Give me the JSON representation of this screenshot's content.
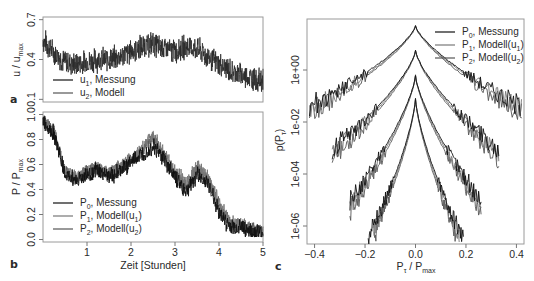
{
  "figure": {
    "panels": [
      "a",
      "b",
      "c"
    ]
  },
  "chart_data": [
    {
      "panel": "a",
      "type": "line",
      "title": "",
      "xlabel": "",
      "ylabel": "u / u_max",
      "ylabel_main": "u / u",
      "ylabel_sub": "max",
      "xlim": [
        0,
        5
      ],
      "ylim": [
        0.08,
        0.72
      ],
      "yticks": [
        0.1,
        0.4,
        0.7
      ],
      "ytick_labels": [
        "0.1",
        "0.4",
        "0.7"
      ],
      "grid": false,
      "legend_position": "bottom-left",
      "legend": [
        {
          "main": "u",
          "sub": "1",
          "rest": ", Messung",
          "color": "#111111"
        },
        {
          "main": "u",
          "sub": "2",
          "rest": ", Modell",
          "color": "#555555"
        }
      ],
      "x": [
        0.0,
        0.25,
        0.5,
        0.75,
        1.0,
        1.25,
        1.5,
        1.75,
        2.0,
        2.25,
        2.5,
        2.75,
        3.0,
        3.25,
        3.5,
        3.75,
        4.0,
        4.25,
        4.5,
        4.75,
        5.0
      ],
      "series": [
        {
          "name": "u1, Messung",
          "center": [
            0.55,
            0.45,
            0.38,
            0.36,
            0.38,
            0.4,
            0.4,
            0.42,
            0.46,
            0.5,
            0.52,
            0.48,
            0.46,
            0.5,
            0.48,
            0.42,
            0.36,
            0.32,
            0.28,
            0.26,
            0.24
          ],
          "amplitude": 0.09
        }
      ]
    },
    {
      "panel": "b",
      "type": "line",
      "title": "",
      "xlabel": "Zeit [Stunden]",
      "ylabel": "P / P_max",
      "ylabel_main": "P / P",
      "ylabel_sub": "max",
      "xlim": [
        0,
        5
      ],
      "ylim": [
        -0.02,
        1.02
      ],
      "xticks": [
        1,
        2,
        3,
        4,
        5
      ],
      "xtick_labels": [
        "1",
        "2",
        "3",
        "4",
        "5"
      ],
      "yticks": [
        0.0,
        0.2,
        0.4,
        0.6,
        0.8,
        1.0
      ],
      "ytick_labels": [
        "0.0",
        "0.2",
        "0.4",
        "0.6",
        "0.8",
        "1.0"
      ],
      "grid": false,
      "legend_position": "bottom-left",
      "legend": [
        {
          "main": "P",
          "sub": "0",
          "rest": ", Messung",
          "color": "#111111"
        },
        {
          "main": "P",
          "sub": "1",
          "rest": ", Modell(u",
          "sub2": "1",
          "end": ")",
          "color": "#777777"
        },
        {
          "main": "P",
          "sub": "2",
          "rest": ", Modell(u",
          "sub2": "2",
          "end": ")",
          "color": "#555555"
        }
      ],
      "x": [
        0.0,
        0.25,
        0.5,
        0.75,
        1.0,
        1.25,
        1.5,
        1.75,
        2.0,
        2.25,
        2.5,
        2.75,
        3.0,
        3.25,
        3.5,
        3.75,
        4.0,
        4.25,
        4.5,
        4.75,
        5.0
      ],
      "series": [
        {
          "name": "P0, Messung",
          "values": [
            0.95,
            0.85,
            0.52,
            0.48,
            0.52,
            0.55,
            0.5,
            0.55,
            0.62,
            0.68,
            0.75,
            0.65,
            0.5,
            0.38,
            0.52,
            0.45,
            0.22,
            0.1,
            0.1,
            0.06,
            0.05
          ],
          "amplitude": 0.08,
          "color": "#111111"
        },
        {
          "name": "P1, Modell(u1)",
          "values": [
            0.96,
            0.88,
            0.55,
            0.5,
            0.55,
            0.58,
            0.52,
            0.58,
            0.65,
            0.72,
            0.85,
            0.68,
            0.55,
            0.45,
            0.58,
            0.5,
            0.3,
            0.14,
            0.12,
            0.08,
            0.06
          ],
          "amplitude": 0.07,
          "color": "#777777"
        },
        {
          "name": "P2, Modell(u2)",
          "values": [
            0.95,
            0.86,
            0.54,
            0.49,
            0.54,
            0.56,
            0.51,
            0.56,
            0.64,
            0.7,
            0.82,
            0.66,
            0.53,
            0.42,
            0.56,
            0.48,
            0.28,
            0.12,
            0.11,
            0.07,
            0.05
          ],
          "amplitude": 0.07,
          "color": "#555555"
        }
      ]
    },
    {
      "panel": "c",
      "type": "line",
      "title": "",
      "xlabel": "P_tau / P_max",
      "xlabel_main": "P",
      "xlabel_sub": "τ",
      "xlabel_rest": " / P",
      "xlabel_sub2": "max",
      "ylabel": "p(P_tau)",
      "ylabel_main": "p(P",
      "ylabel_sub": "τ",
      "ylabel_end": ")",
      "yscale": "log",
      "xlim": [
        -0.43,
        0.43
      ],
      "xticks": [
        -0.4,
        -0.2,
        0.0,
        0.2,
        0.4
      ],
      "xtick_labels": [
        "-0.4",
        "-0.2",
        "0.0",
        "0.2",
        "0.4"
      ],
      "yticks_log10": [
        0,
        -2,
        -4,
        -6
      ],
      "ytick_labels": [
        "1e+00",
        "1e-02",
        "1e-04",
        "1e-06"
      ],
      "grid": false,
      "legend_position": "top-right",
      "legend": [
        {
          "main": "P",
          "sub": "0",
          "rest": ", Messung",
          "color": "#111111"
        },
        {
          "main": "P",
          "sub": "1",
          "rest": ", Modell(u",
          "sub2": "1",
          "end": ")",
          "color": "#777777"
        },
        {
          "main": "P",
          "sub": "2",
          "rest": ", Modell(u",
          "sub2": "2",
          "end": ")",
          "color": "#555555"
        }
      ],
      "note": "Four vertically offset groups of distributions (different time scales tau), each with three curves (P0, P1, P2). Peak log10 values approx.",
      "groups": [
        {
          "peak_log10": 1.7,
          "decay": 11,
          "tail_x": 0.42
        },
        {
          "peak_log10": 0.75,
          "decay": 16,
          "tail_x": 0.33
        },
        {
          "peak_log10": -0.2,
          "decay": 24,
          "tail_x": 0.26
        },
        {
          "peak_log10": -1.1,
          "decay": 34,
          "tail_x": 0.19
        }
      ]
    }
  ]
}
